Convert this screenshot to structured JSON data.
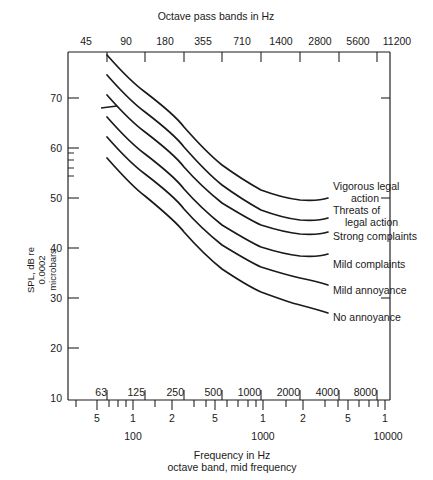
{
  "chart_data": {
    "type": "line",
    "title": "",
    "xlabel": "Frequency in Hz",
    "xlabel_sub": "octave band, mid frequency",
    "ylabel_lines": [
      "SPL, dB re",
      "0.0002",
      "microbars"
    ],
    "top_axis_title": "Octave pass bands in Hz",
    "top_axis_ticks": [
      "45",
      "90",
      "180",
      "355",
      "710",
      "1400",
      "2800",
      "5600",
      "11200"
    ],
    "octave_band_labels": [
      "63",
      "125",
      "250",
      "500",
      "1000",
      "2000",
      "4000",
      "8000"
    ],
    "decade_labels": [
      "100",
      "1000",
      "10000"
    ],
    "log_minor_labels": [
      "5",
      "1",
      "2",
      "5",
      "1",
      "2",
      "5",
      "1"
    ],
    "ylim": [
      10,
      80
    ],
    "yticks": [
      "10",
      "20",
      "30",
      "40",
      "50",
      "60",
      "70"
    ],
    "xlim": [
      40,
      12000
    ],
    "grid": false,
    "legend": "inline-right",
    "x": [
      63,
      125,
      250,
      500,
      1000,
      2000,
      4000,
      8000
    ],
    "series": [
      {
        "name": "Vigorous legal action",
        "values": [
          79,
          72,
          65,
          59.5,
          55,
          52,
          50,
          48
        ]
      },
      {
        "name": "Threats of legal action",
        "values": [
          75,
          68,
          61,
          55.5,
          51,
          48,
          46,
          44
        ]
      },
      {
        "name": "Strong complaints",
        "values": [
          71,
          64,
          57,
          51.5,
          47,
          44,
          42,
          40.5
        ]
      },
      {
        "name": "Mild complaints",
        "values": [
          67,
          60,
          53,
          47.5,
          43,
          40,
          38,
          36.5
        ]
      },
      {
        "name": "Mild annoyance",
        "values": [
          63,
          56,
          49,
          43.5,
          39,
          36,
          34,
          32.5
        ]
      },
      {
        "name": "No annoyance",
        "values": [
          59,
          52,
          45,
          39.5,
          35,
          31,
          28,
          27
        ]
      }
    ],
    "annotations": [
      {
        "name": "reference-marker",
        "x": 63,
        "y": 68
      }
    ],
    "colors": {
      "line": "#1a1a1a",
      "axis": "#1a1a1a",
      "background": "#ffffff"
    }
  }
}
